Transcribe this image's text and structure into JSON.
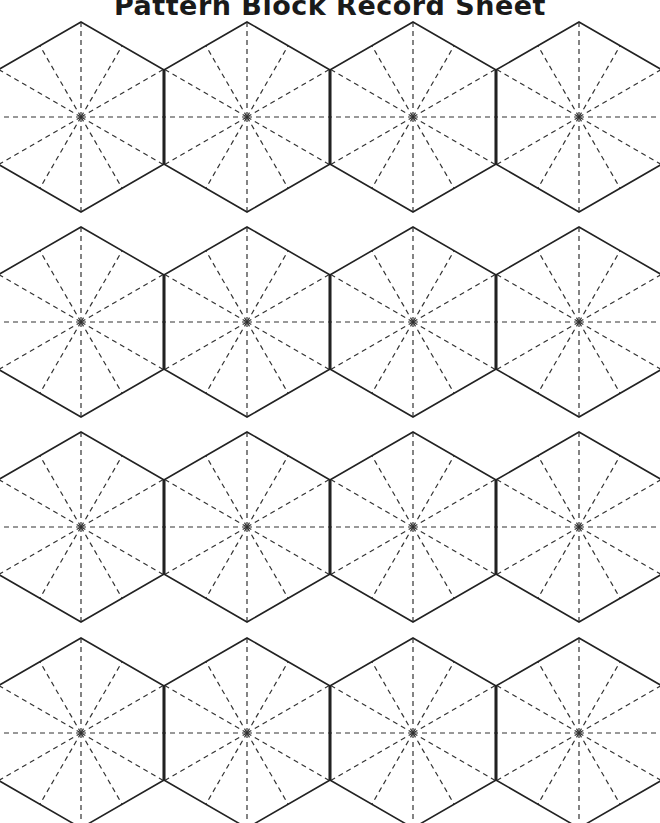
{
  "document": {
    "title": "Pattern Block Record Sheet"
  },
  "grid": {
    "columns": [
      81,
      247,
      413,
      579
    ],
    "rows": [
      117,
      322,
      527,
      733
    ],
    "radius": 95,
    "stroke_color": "#222222",
    "dash_color": "#333333",
    "cell_count": 16
  }
}
